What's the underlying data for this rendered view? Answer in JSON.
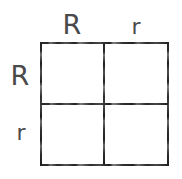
{
  "figure": {
    "type": "punnett-square",
    "background_color": "#ffffff",
    "ink_color": "#2e2e2e",
    "text_color": "#4a4a4a"
  },
  "column_labels": [
    {
      "text": "R",
      "allele": "dominant"
    },
    {
      "text": "r",
      "allele": "recessive"
    }
  ],
  "row_labels": [
    {
      "text": "R",
      "allele": "dominant"
    },
    {
      "text": "r",
      "allele": "recessive"
    }
  ],
  "cells": [
    [
      {
        "text": ""
      },
      {
        "text": ""
      }
    ],
    [
      {
        "text": ""
      },
      {
        "text": ""
      }
    ]
  ],
  "chart_data": {
    "type": "table",
    "xlabel": "",
    "ylabel": "",
    "columns": [
      "R",
      "r"
    ],
    "rows": [
      "R",
      "r"
    ],
    "values": [
      [
        "",
        ""
      ],
      [
        "",
        ""
      ]
    ],
    "grid": true,
    "legend": "none"
  }
}
